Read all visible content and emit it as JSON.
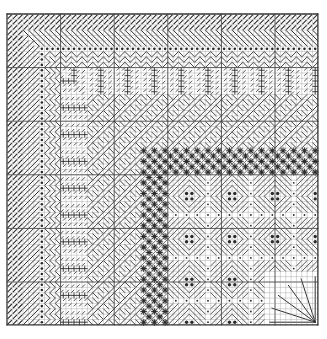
{
  "diagram": {
    "title": "Needlepoint stitch pattern chart",
    "type": "stitch-grid",
    "grid": {
      "origin_x": 7,
      "origin_y": 14,
      "cols": 58,
      "rows": 58,
      "cell": 5.36,
      "major_every": 10,
      "line_color": "#9a9a9a",
      "major_color": "#444444",
      "border_color": "#333333",
      "stitch_color": "#2a2a2a",
      "background": "#ffffff"
    },
    "bands": [
      {
        "name": "tent-stitch-border",
        "stitch": "tent",
        "frame_from": 0,
        "frame_to": 3
      },
      {
        "name": "slanted-gobelin-band",
        "stitch": "slanted-gobelin",
        "frame_from": 3,
        "frame_to": 6
      },
      {
        "name": "dot-row",
        "stitch": "dots",
        "frame_from": 6,
        "frame_to": 6.5
      },
      {
        "name": "zigzag-band",
        "stitch": "zigzag",
        "frame_from": 6.5,
        "frame_to": 10
      },
      {
        "name": "fan-cross-band",
        "stitch": "fan-cross",
        "frame_from": 10,
        "frame_to": 15
      },
      {
        "name": "woven-diagonal-band",
        "stitch": "woven",
        "frame_from": 15,
        "frame_to": 25
      },
      {
        "name": "star-stitch-band",
        "stitch": "star",
        "frame_from": 25,
        "frame_to": 30
      },
      {
        "name": "diamond-rhodes-center",
        "stitch": "diamond",
        "frame_from": 30,
        "frame_to": 58
      }
    ],
    "corner_fan": {
      "name": "corner-fan-motif",
      "col": 48,
      "row": 48,
      "size": 10,
      "rays": 6
    }
  }
}
